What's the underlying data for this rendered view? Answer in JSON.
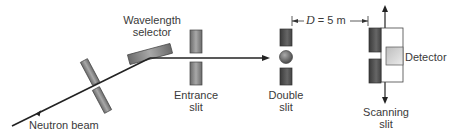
{
  "diagram": {
    "labels": {
      "neutron_beam": "Neutron beam",
      "wavelength_selector_line1": "Wavelength",
      "wavelength_selector_line2": "selector",
      "entrance_slit_line1": "Entrance",
      "entrance_slit_line2": "slit",
      "double_slit_line1": "Double",
      "double_slit_line2": "slit",
      "scanning_slit_line1": "Scanning",
      "scanning_slit_line2": "slit",
      "detector": "Detector"
    },
    "dimension": {
      "symbol": "D",
      "equals": " = 5 m",
      "value": 5,
      "unit": "m"
    },
    "colors": {
      "beam": "#222222",
      "slit_fill_dark": "#555555",
      "slit_fill_mid": "#8a8a8a",
      "detector_fill": "#d8d8d8",
      "text": "#3a3a3a"
    }
  }
}
